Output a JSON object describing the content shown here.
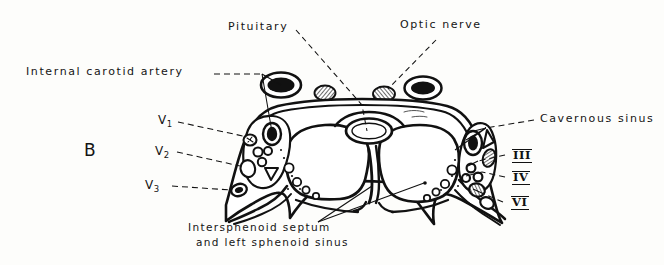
{
  "figure": {
    "panel_label": "B",
    "kind": "anatomical-line-drawing",
    "background_color": "#fdfdfb",
    "ink_color": "#111111"
  },
  "labels": {
    "internal_carotid_artery": "Internal carotid artery",
    "pituitary": "Pituitary",
    "optic_nerve": "Optic nerve",
    "cavernous_sinus": "Cavernous sinus",
    "v1": "V",
    "v1_sub": "1",
    "v2": "V",
    "v2_sub": "2",
    "v3": "V",
    "v3_sub": "3",
    "nerve_iii": "III",
    "nerve_iv": "IV",
    "nerve_vi": "VI",
    "caption_line1": "Intersphenoid septum",
    "caption_line2": "and left sphenoid sinus"
  }
}
